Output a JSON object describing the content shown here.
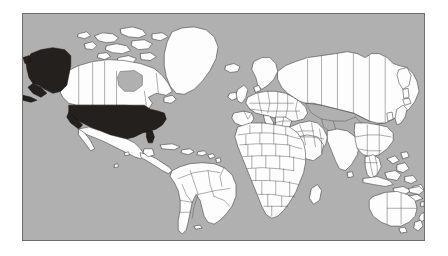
{
  "page": {
    "background_color": "#ffffff",
    "width": 448,
    "height": 256
  },
  "map": {
    "title": "World Map",
    "projection": "equirectangular",
    "frame": {
      "border_color": "#6e6e6e",
      "border_width_px": 1.5,
      "x": 22,
      "y": 13,
      "width": 403,
      "height": 228
    },
    "ocean_color": "#b0b0b0",
    "land_color": "#fdfdfd",
    "land_border_color": "#3a3a3a",
    "country_border_color": "#4a4a4a",
    "highlight_color": "#23201e",
    "highlighted_regions": [
      "united-states-contiguous",
      "united-states-alaska"
    ],
    "legend": [],
    "labels": [],
    "continents_shown": [
      "North America",
      "South America",
      "Europe",
      "Africa",
      "Asia",
      "Oceania"
    ]
  }
}
